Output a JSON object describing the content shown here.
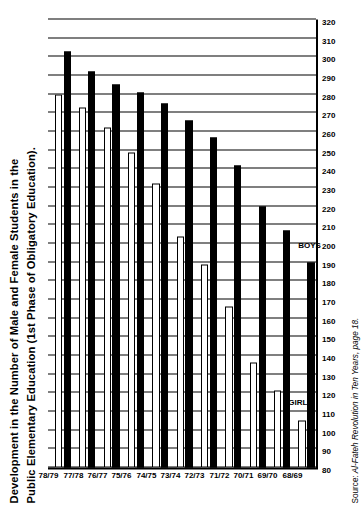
{
  "chart_data": {
    "type": "bar",
    "orientation": "horizontal",
    "title": "Development in the Number of Male and Female Students in the Public Elementary Education (1st Phase of Obligatory Education).",
    "title_line1": "Development in the Number of Male and Female Students in the",
    "title_line2": "Public Elementary Education (1st Phase of Obligatory Education).",
    "xlabel": "",
    "ylabel": "",
    "categories": [
      "68/69",
      "69/70",
      "70/71",
      "71/72",
      "72/73",
      "73/74",
      "74/75",
      "75/76",
      "76/77",
      "77/78",
      "78/79"
    ],
    "tick_labels": [
      "80",
      "90",
      "100",
      "110",
      "120",
      "130",
      "140",
      "150",
      "160",
      "170",
      "180",
      "190",
      "200",
      "210",
      "220",
      "230",
      "240",
      "250",
      "260",
      "270",
      "280",
      "290",
      "300",
      "310",
      "320"
    ],
    "value_axis_min": 80,
    "value_axis_max": 320,
    "value_axis_step": 10,
    "grid": true,
    "legend_position": "inline-annotation",
    "series": [
      {
        "name": "BOYS",
        "fill": "#000000",
        "values": [
          190,
          207,
          220,
          242,
          257,
          266,
          275,
          281,
          285,
          292,
          303
        ]
      },
      {
        "name": "GIRLS",
        "fill": "#FFFFFF",
        "values": [
          105,
          121,
          136,
          166,
          189,
          204,
          232,
          249,
          262,
          273,
          280
        ]
      }
    ],
    "annotations": [
      {
        "text": "BOYS",
        "series": "BOYS",
        "category": "68/69"
      },
      {
        "text": "GIRLS",
        "series": "GIRLS",
        "category": "68/69"
      }
    ],
    "source_label": "Source:",
    "source_text": "Al-Fateh Revolution in Ten Years, page 18."
  },
  "colors": {
    "ink": "#000000",
    "paper": "#ffffff",
    "boys": "#000000",
    "girls": "#ffffff"
  }
}
